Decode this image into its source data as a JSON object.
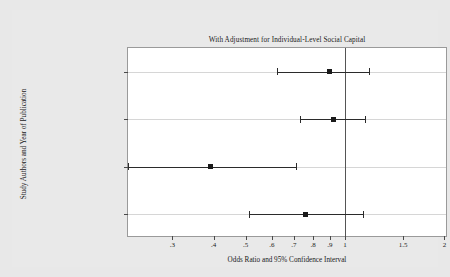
{
  "chart_data": {
    "type": "scatter",
    "chart_kind": "forest-plot",
    "title": "With Adjustment for Individual-Level Social Capital",
    "xlabel": "Odds Ratio and 95% Confidence Interval",
    "ylabel": "Study Authors and Year of Publication",
    "xscale": "log",
    "xlim": [
      0.22,
      2.05
    ],
    "grid": true,
    "legend": "none",
    "reference_line": 1,
    "xticks": [
      {
        "value": 0.3,
        "label": ".3"
      },
      {
        "value": 0.4,
        "label": ".4"
      },
      {
        "value": 0.5,
        "label": ".5"
      },
      {
        "value": 0.6,
        "label": ".6"
      },
      {
        "value": 0.7,
        "label": ".7"
      },
      {
        "value": 0.8,
        "label": ".8"
      },
      {
        "value": 0.9,
        "label": ".9"
      },
      {
        "value": 1.0,
        "label": "1"
      },
      {
        "value": 1.5,
        "label": "1.5"
      },
      {
        "value": 2.0,
        "label": "2"
      }
    ],
    "categories": [
      "Subramanian et al., 2002",
      "Poortinga, 2006a",
      "Poortinga, 2006c",
      "Yip et al., in press"
    ],
    "studies": [
      {
        "label": "Subramanian et al., 2002",
        "odds_ratio": 0.9,
        "ci_low": 0.62,
        "ci_high": 1.18
      },
      {
        "label": "Poortinga, 2006a",
        "odds_ratio": 0.92,
        "ci_low": 0.73,
        "ci_high": 1.15
      },
      {
        "label": "Poortinga, 2006c",
        "odds_ratio": 0.39,
        "ci_low": 0.22,
        "ci_high": 0.71
      },
      {
        "label": "Yip et al., in press",
        "odds_ratio": 0.76,
        "ci_low": 0.51,
        "ci_high": 1.13
      }
    ],
    "colors": {
      "marker": "#1a1a1a",
      "ci_line": "#2b2b2b",
      "reference_line": "#555555",
      "gridline": "#d6d6d6",
      "plot_background": "#ffffff",
      "figure_background": "#e9e9e9",
      "axis_border": "#9a9a9a",
      "text": "#1a1a1a"
    }
  }
}
